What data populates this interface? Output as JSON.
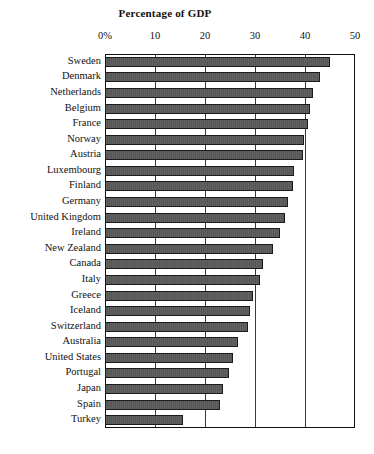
{
  "chart_data": {
    "type": "bar",
    "orientation": "horizontal",
    "title": "Percentage of GDP",
    "xlabel": "",
    "ylabel": "",
    "xlim": [
      0,
      50
    ],
    "grid": true,
    "legend": "none",
    "xticks": [
      {
        "value": 0,
        "label": "0%"
      },
      {
        "value": 10,
        "label": "10"
      },
      {
        "value": 20,
        "label": "20"
      },
      {
        "value": 30,
        "label": "30"
      },
      {
        "value": 40,
        "label": "40"
      },
      {
        "value": 50,
        "label": "50"
      }
    ],
    "categories": [
      "Sweden",
      "Denmark",
      "Netherlands",
      "Belgium",
      "France",
      "Norway",
      "Austria",
      "Luxembourg",
      "Finland",
      "Germany",
      "United Kingdom",
      "Ireland",
      "New Zealand",
      "Canada",
      "Italy",
      "Greece",
      "Iceland",
      "Switzerland",
      "Australia",
      "United States",
      "Portugal",
      "Japan",
      "Spain",
      "Turkey"
    ],
    "values": [
      45.0,
      43.0,
      41.5,
      41.0,
      40.5,
      39.8,
      39.5,
      37.8,
      37.5,
      36.5,
      36.0,
      35.0,
      33.5,
      31.5,
      31.0,
      29.5,
      29.0,
      28.5,
      26.5,
      25.5,
      24.8,
      23.5,
      23.0,
      15.5
    ],
    "series": [
      {
        "name": "Percentage of GDP",
        "values": [
          45.0,
          43.0,
          41.5,
          41.0,
          40.5,
          39.8,
          39.5,
          37.8,
          37.5,
          36.5,
          36.0,
          35.0,
          33.5,
          31.5,
          31.0,
          29.5,
          29.0,
          28.5,
          26.5,
          25.5,
          24.8,
          23.5,
          23.0,
          15.5
        ]
      }
    ],
    "bar_color": "#5a5a5a",
    "bar_edge_color": "#1b1b1b",
    "axis_color": "#111111",
    "background_color": "#ffffff"
  }
}
